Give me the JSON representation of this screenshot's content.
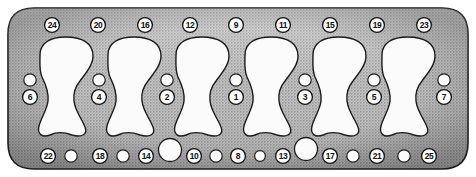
{
  "figure": {
    "colors": {
      "body_fill": "#b9b9b9",
      "body_stroke": "#1a1a1a",
      "hole_fill": "#fbfbfb",
      "hole_stroke": "#1a1a1a",
      "marker_stroke": "#121212",
      "number_color": "#101010",
      "page_background": "#ffffff"
    }
  },
  "numbered_holes": {
    "top_row": [
      {
        "label": "24",
        "cx": 52,
        "cy": 25
      },
      {
        "label": "20",
        "cx": 98,
        "cy": 25
      },
      {
        "label": "16",
        "cx": 145,
        "cy": 25
      },
      {
        "label": "12",
        "cx": 190,
        "cy": 25
      },
      {
        "label": "9",
        "cx": 236,
        "cy": 25
      },
      {
        "label": "11",
        "cx": 283,
        "cy": 25
      },
      {
        "label": "15",
        "cx": 330,
        "cy": 25
      },
      {
        "label": "19",
        "cx": 377,
        "cy": 25
      },
      {
        "label": "23",
        "cx": 424,
        "cy": 25
      }
    ],
    "middle_row": [
      {
        "label": "6",
        "cx": 30,
        "cy": 97
      },
      {
        "label": "4",
        "cx": 99,
        "cy": 97
      },
      {
        "label": "2",
        "cx": 167,
        "cy": 97
      },
      {
        "label": "1",
        "cx": 236,
        "cy": 97
      },
      {
        "label": "3",
        "cx": 305,
        "cy": 97
      },
      {
        "label": "5",
        "cx": 374,
        "cy": 97
      },
      {
        "label": "7",
        "cx": 444,
        "cy": 97
      }
    ],
    "bottom_row": [
      {
        "label": "22",
        "cx": 48,
        "cy": 156
      },
      {
        "label": "18",
        "cx": 100,
        "cy": 156
      },
      {
        "label": "14",
        "cx": 146,
        "cy": 156
      },
      {
        "label": "10",
        "cx": 194,
        "cy": 156
      },
      {
        "label": "8",
        "cx": 238,
        "cy": 156
      },
      {
        "label": "13",
        "cx": 283,
        "cy": 156
      },
      {
        "label": "17",
        "cx": 330,
        "cy": 156
      },
      {
        "label": "21",
        "cx": 377,
        "cy": 156
      },
      {
        "label": "25",
        "cx": 429,
        "cy": 156
      }
    ]
  },
  "plain_holes": {
    "middle_row": [
      {
        "cx": 30,
        "cy": 80
      },
      {
        "cx": 99,
        "cy": 80
      },
      {
        "cx": 167,
        "cy": 80
      },
      {
        "cx": 236,
        "cy": 80
      },
      {
        "cx": 305,
        "cy": 80
      },
      {
        "cx": 374,
        "cy": 80
      },
      {
        "cx": 444,
        "cy": 80
      }
    ],
    "bottom_row": [
      {
        "cx": 71,
        "cy": 156,
        "r": 6.2
      },
      {
        "cx": 123,
        "cy": 156,
        "r": 6.2
      },
      {
        "cx": 216,
        "cy": 156,
        "r": 6.2
      },
      {
        "cx": 260,
        "cy": 156,
        "r": 5.4
      },
      {
        "cx": 353,
        "cy": 156,
        "r": 6.2
      },
      {
        "cx": 404,
        "cy": 156,
        "r": 6.2
      }
    ]
  },
  "water_passages": [
    {
      "cx": 170,
      "cy": 150,
      "r": 11.5
    },
    {
      "cx": 306,
      "cy": 149,
      "r": 11.5
    }
  ],
  "cylinder_bores": [
    {
      "index": 1,
      "cx": 66
    },
    {
      "index": 2,
      "cx": 134
    },
    {
      "index": 3,
      "cx": 202
    },
    {
      "index": 4,
      "cx": 271
    },
    {
      "index": 5,
      "cx": 339
    },
    {
      "index": 6,
      "cx": 408
    }
  ]
}
